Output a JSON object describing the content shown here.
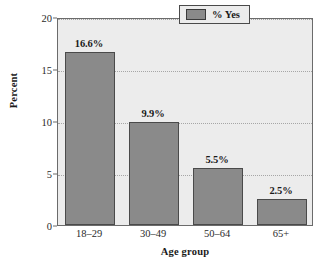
{
  "chart_data": {
    "type": "bar",
    "title": "",
    "subtitle": "",
    "categories": [
      "18–29",
      "30–49",
      "50–64",
      "65+"
    ],
    "values": [
      16.6,
      9.9,
      5.5,
      2.5
    ],
    "data_labels": [
      "16.6%",
      "9.9%",
      "5.5%",
      "2.5%"
    ],
    "series": [
      {
        "name": "% Yes",
        "values": [
          16.6,
          9.9,
          5.5,
          2.5
        ],
        "color": "#8a8a8a"
      }
    ],
    "xlabel": "Age group",
    "ylabel": "Percent",
    "ylim": [
      0,
      20
    ],
    "yticks": [
      0,
      5,
      10,
      15,
      20
    ],
    "ytick_labels": [
      "0",
      "5",
      "10",
      "15",
      "20"
    ],
    "grid": true,
    "grid_style": "dotted",
    "legend_position": "top-right",
    "legend_entries": [
      "% Yes"
    ],
    "plot_background": "#ececec",
    "bar_color": "#8a8a8a",
    "bar_edge_color": "#4a4a4a"
  },
  "legend": {
    "label": "% Yes"
  },
  "axes": {
    "x_title": "Age group",
    "y_title": "Percent"
  }
}
